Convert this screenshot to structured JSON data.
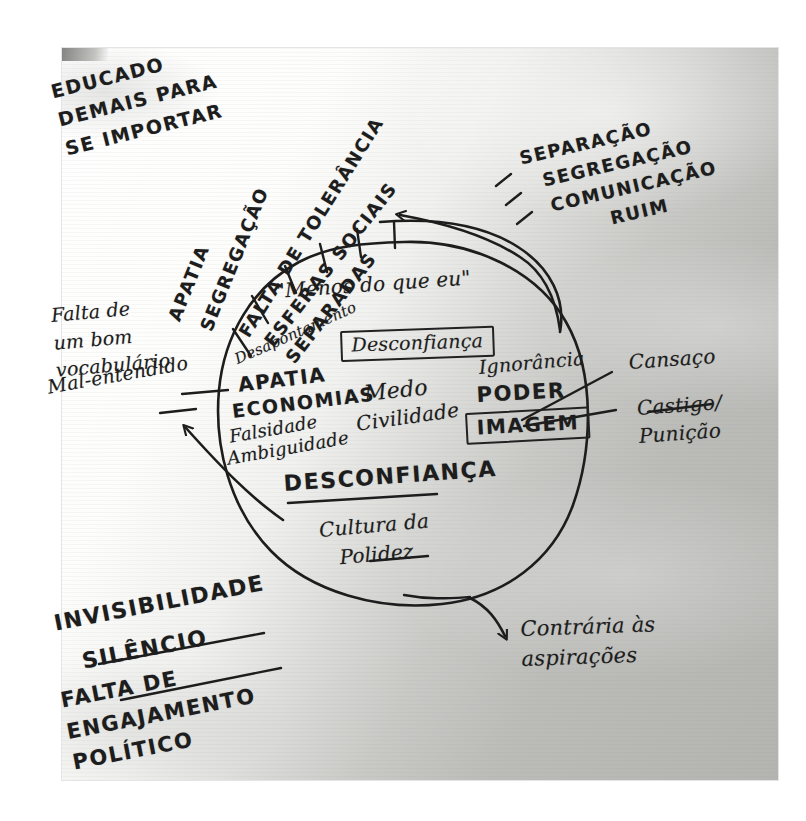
{
  "document": {
    "kind": "handwritten-mind-map-photo",
    "language": "pt-BR",
    "central_shape": "hand-drawn circle",
    "ink_color": "#1d1d1d",
    "paper_color": "#fcfcfb"
  },
  "outside_top_left": {
    "note": "EDUCADO\nDEMAIS PARA\nSE IMPORTAR"
  },
  "spokes_top_left": [
    {
      "label": "APATIA"
    },
    {
      "label": "SEGREGAÇÃO"
    },
    {
      "label": "FALTA DE TOLERÂNCIA"
    },
    {
      "label": "ESFERAS SOCIAIS\nSEPARADAS"
    }
  ],
  "outside_top_right": {
    "items": [
      {
        "bullet": "-",
        "label": "SEPARAÇÃO"
      },
      {
        "bullet": "-",
        "label": "SEGREGAÇÃO"
      },
      {
        "bullet": "-",
        "label": "COMUNICAÇÃO\nRUIM"
      }
    ]
  },
  "outside_left": {
    "vocabulary_note": "Falta de\num bom\nvocabulário",
    "misunderstanding_note": "Mal-entendido"
  },
  "outside_right": {
    "items": [
      {
        "label": "Cansaço"
      },
      {
        "label": "Castigo/\nPunição"
      }
    ]
  },
  "inside_circle": {
    "quote": "\"Menos do que eu\"",
    "disappointment": "Desapontamento",
    "boxed_distrust": "Desconfiança",
    "left_column": [
      {
        "label": "APATIA",
        "style": "caps"
      },
      {
        "label": "ECONOMIAS",
        "style": "caps"
      },
      {
        "label": "Falsidade",
        "style": "cursive"
      },
      {
        "label": "Ambiguidade",
        "style": "cursive"
      }
    ],
    "middle_column": [
      {
        "label": "Medo",
        "style": "cursive"
      },
      {
        "label": "Civilidade",
        "style": "cursive"
      }
    ],
    "right_column": [
      {
        "label": "Ignorância",
        "style": "cursive"
      },
      {
        "label": "PODER",
        "style": "caps"
      }
    ],
    "boxed_image": "IMAGEM",
    "underlined_distrust": "DESCONFIANÇA",
    "politeness_culture": "Cultura da\nPolidez"
  },
  "outside_bottom_left": {
    "items": [
      {
        "label": "INVISIBILIDADE",
        "underlined": true
      },
      {
        "label": "SILÊNCIO",
        "underlined": true
      },
      {
        "label": "FALTA DE\nENGAJAMENTO\nPOLÍTICO",
        "underlined": false
      }
    ]
  },
  "outside_bottom_right": {
    "note": "Contrária às\naspirações"
  },
  "arrows": [
    {
      "name": "arrow-to-esferas-sociais",
      "direction": "up-left",
      "from": "circle right edge",
      "to": "ESFERAS SOCIAIS SEPARADAS"
    },
    {
      "name": "arrow-to-mal-entendido",
      "direction": "up-left",
      "from": "inside circle",
      "to": "Mal-entendido"
    },
    {
      "name": "arrow-to-aspiracoes",
      "direction": "down-right",
      "from": "circle bottom",
      "to": "Contrária às aspirações"
    }
  ]
}
